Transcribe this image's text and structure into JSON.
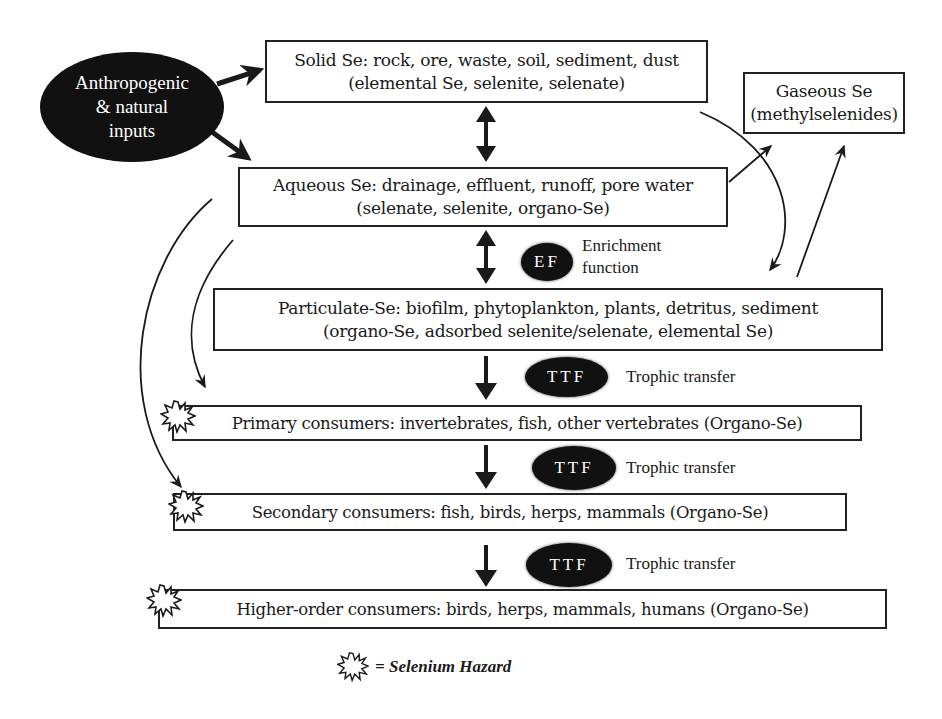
{
  "diagram": {
    "type": "flowchart"
  },
  "inputs": {
    "label_lines": [
      "Anthropogenic",
      "& natural",
      "inputs"
    ]
  },
  "nodes": {
    "solid": {
      "line1": "Solid Se: rock, ore, waste, soil, sediment, dust",
      "line2": "(elemental Se, selenite, selenate)"
    },
    "gaseous": {
      "line1": "Gaseous Se",
      "line2": "(methylselenides)"
    },
    "aqueous": {
      "line1": "Aqueous Se: drainage, effluent, runoff, pore water",
      "line2": "(selenate, selenite, organo-Se)"
    },
    "particulate": {
      "line1": "Particulate-Se: biofilm, phytoplankton, plants, detritus, sediment",
      "line2": "(organo-Se, adsorbed selenite/selenate, elemental Se)"
    },
    "primary": {
      "text": "Primary consumers: invertebrates, fish, other vertebrates (Organo-Se)"
    },
    "secondary": {
      "text": "Secondary consumers: fish, birds, herps, mammals (Organo-Se)"
    },
    "higher": {
      "text": "Higher-order consumers: birds, herps, mammals, humans (Organo-Se)"
    }
  },
  "factors": {
    "ef": {
      "badge": "EF",
      "label_line1": "Enrichment",
      "label_line2": "function"
    },
    "ttf1": {
      "badge": "TTF",
      "label": "Trophic transfer"
    },
    "ttf2": {
      "badge": "TTF",
      "label": "Trophic transfer"
    },
    "ttf3": {
      "badge": "TTF",
      "label": "Trophic transfer"
    }
  },
  "legend": {
    "icon": "hazard-burst-icon",
    "text": "= Selenium Hazard"
  },
  "colors": {
    "ink": "#1a1a1a",
    "oval_fill": "#111111",
    "background": "#ffffff"
  }
}
